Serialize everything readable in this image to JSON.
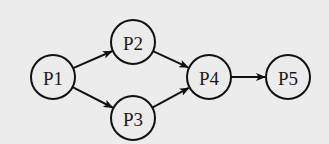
{
  "diagram": {
    "type": "directed-graph",
    "background": "#ececec",
    "stroke_color": "#111111",
    "node_radius": 22,
    "nodes": [
      {
        "id": "P1",
        "label": "P1",
        "cx": 53,
        "cy": 77
      },
      {
        "id": "P2",
        "label": "P2",
        "cx": 133,
        "cy": 42
      },
      {
        "id": "P3",
        "label": "P3",
        "cx": 133,
        "cy": 118
      },
      {
        "id": "P4",
        "label": "P4",
        "cx": 209,
        "cy": 77
      },
      {
        "id": "P5",
        "label": "P5",
        "cx": 288,
        "cy": 77
      }
    ],
    "edges": [
      {
        "from": "P1",
        "to": "P2"
      },
      {
        "from": "P1",
        "to": "P3"
      },
      {
        "from": "P2",
        "to": "P4"
      },
      {
        "from": "P3",
        "to": "P4"
      },
      {
        "from": "P4",
        "to": "P5"
      }
    ]
  }
}
